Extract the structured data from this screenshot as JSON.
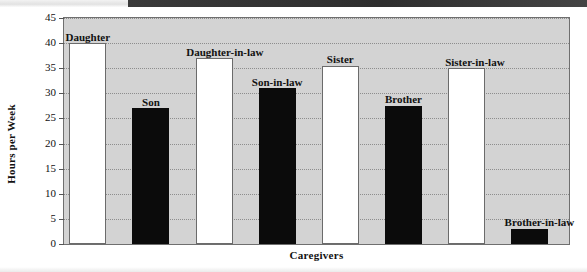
{
  "chart_data": {
    "type": "bar",
    "title": "",
    "xlabel": "Caregivers",
    "ylabel": "Hours per Week",
    "ylim": [
      0,
      45
    ],
    "ytick_step": 5,
    "yticks": [
      "45",
      "40",
      "35",
      "30",
      "25",
      "20",
      "15",
      "10",
      "5",
      "0"
    ],
    "grid": true,
    "legend": false,
    "categories": [
      "Daughter",
      "Son",
      "Daughter-in-law",
      "Son-in-law",
      "Sister",
      "Brother",
      "Sister-in-law",
      "Brother-in-law"
    ],
    "values": [
      40,
      27,
      37,
      31,
      35.5,
      27.5,
      35,
      3
    ],
    "bars": [
      {
        "label": "Daughter",
        "value": 40,
        "style": "light"
      },
      {
        "label": "Son",
        "value": 27,
        "style": "dark"
      },
      {
        "label": "Daughter-in-law",
        "value": 37,
        "style": "light"
      },
      {
        "label": "Son-in-law",
        "value": 31,
        "style": "dark"
      },
      {
        "label": "Sister",
        "value": 35.5,
        "style": "light"
      },
      {
        "label": "Brother",
        "value": 27.5,
        "style": "dark"
      },
      {
        "label": "Sister-in-law",
        "value": 35,
        "style": "light"
      },
      {
        "label": "Brother-in-law",
        "value": 3,
        "style": "dark"
      }
    ],
    "colors": {
      "plot_background": "#d3d3d3",
      "light_bar": "#ffffff",
      "dark_bar": "#0b0b0b",
      "axis": "#6f6f6f",
      "gridline": "#8d8d8d",
      "text": "#111111"
    }
  }
}
